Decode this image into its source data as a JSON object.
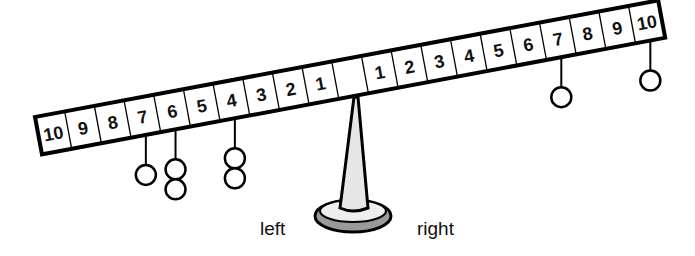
{
  "diagram": {
    "labels": {
      "left": "left",
      "right": "right"
    },
    "beam": {
      "cells": [
        "10",
        "9",
        "8",
        "7",
        "6",
        "5",
        "4",
        "3",
        "2",
        "1",
        "",
        "1",
        "2",
        "3",
        "4",
        "5",
        "6",
        "7",
        "8",
        "9",
        "10"
      ]
    },
    "weights": [
      {
        "side": "left",
        "position": 7,
        "count": 1
      },
      {
        "side": "left",
        "position": 6,
        "count": 2
      },
      {
        "side": "left",
        "position": 4,
        "count": 2
      },
      {
        "side": "right",
        "position": 7,
        "count": 1
      },
      {
        "side": "right",
        "position": 10,
        "count": 1
      }
    ],
    "colors": {
      "stroke": "#000000",
      "pillar": "#e6e6e6",
      "base_top": "#eeeeee",
      "base_rim": "#9a9a9a"
    }
  }
}
